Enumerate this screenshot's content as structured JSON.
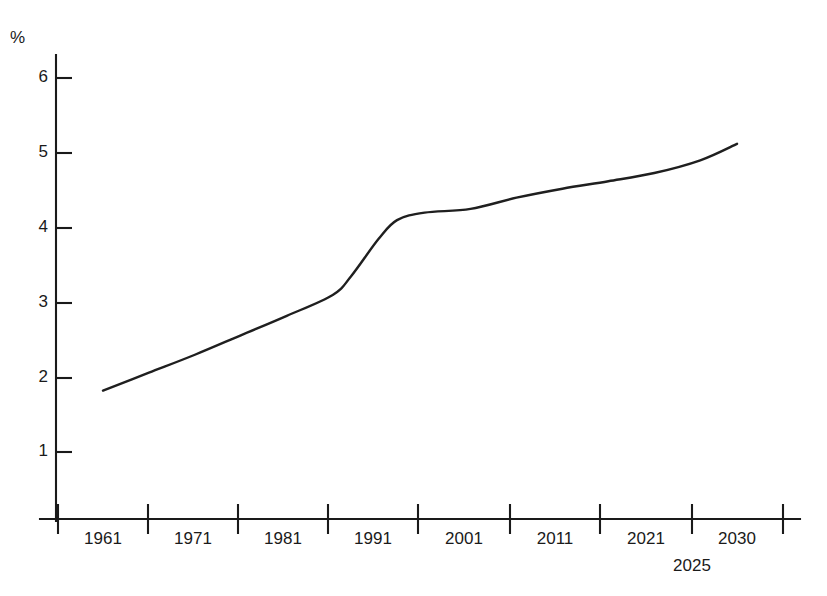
{
  "chart_data": {
    "type": "line",
    "title": "",
    "subtitle": "",
    "xlabel": "",
    "ylabel": "%",
    "unit_symbol": "%",
    "grid": false,
    "legend": null,
    "xlim": [
      1956,
      2035
    ],
    "ylim": [
      0,
      6.3
    ],
    "y_ticks": [
      1,
      2,
      3,
      4,
      5,
      6
    ],
    "y_tick_labels": [
      "1",
      "2",
      "3",
      "4",
      "5",
      "6"
    ],
    "x_tick_years": [
      1956,
      1966,
      1976,
      1986,
      1996,
      2006,
      2016,
      2025,
      2035
    ],
    "x_tick_labels_primary": [
      "1961",
      "1971",
      "1981",
      "1991",
      "2001",
      "2011",
      "2021",
      "2030"
    ],
    "x_tick_labels_secondary": [
      "2025"
    ],
    "series": [
      {
        "name": "share",
        "x": [
          1961,
          1966,
          1971,
          1976,
          1981,
          1986,
          1988,
          1991,
          1993,
          1996,
          2001,
          2006,
          2011,
          2016,
          2021,
          2026,
          2030
        ],
        "values": [
          1.82,
          2.06,
          2.3,
          2.56,
          2.82,
          3.1,
          3.35,
          3.85,
          4.1,
          4.2,
          4.25,
          4.4,
          4.52,
          4.62,
          4.73,
          4.9,
          5.12
        ]
      }
    ],
    "line_color": "#1f1f1f",
    "axis_color": "#1a1a1a",
    "background_color": "#ffffff"
  },
  "geometry": {
    "plot_left_px": 55,
    "plot_baseline_px": 518,
    "plot_right_px": 800,
    "y_top_px": 55,
    "y_value_6_px": 78,
    "y_unit_px": 74.8,
    "x_tick_px": [
      58,
      148,
      238,
      328,
      418,
      510,
      600,
      692,
      783
    ],
    "x_label_centers_px": [
      103,
      193,
      283,
      373,
      464,
      555,
      646,
      737
    ],
    "secondary_label_center_px": 692,
    "curve_start_px": [
      103,
      385
    ],
    "curve_end_px": [
      737,
      143
    ]
  }
}
